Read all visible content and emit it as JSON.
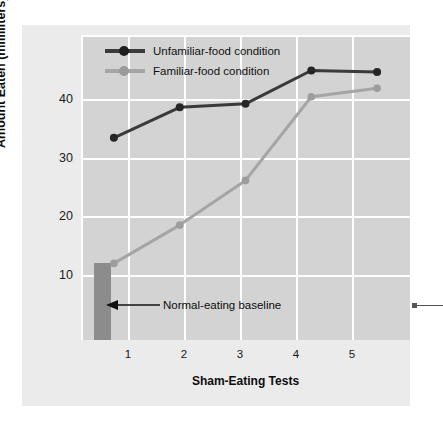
{
  "chart_data": {
    "type": "line",
    "title": "",
    "xlabel": "Sham-Eating Tests",
    "ylabel": "Amount Eaten (milliliters)",
    "categories": [
      "1",
      "2",
      "3",
      "4",
      "5"
    ],
    "x": [
      1,
      2,
      3,
      4,
      5
    ],
    "xlim": [
      0.5,
      5.5
    ],
    "ylim": [
      0,
      43
    ],
    "yticks": [
      10,
      20,
      30,
      40
    ],
    "ytick_labels": [
      "10",
      "20",
      "30",
      "40"
    ],
    "xtick_labels": [
      "1",
      "2",
      "3",
      "4",
      "5"
    ],
    "grid": "white gridlines, horizontal at y ticks and vertical at x ticks",
    "legend_position": "top-left inside plot",
    "series": [
      {
        "name": "Unfamiliar-food condition",
        "color": "#3a3a3a",
        "values": [
          28.5,
          32.8,
          33.3,
          38.0,
          37.8
        ]
      },
      {
        "name": "Familiar-food condition",
        "color": "#a5a5a5",
        "values": [
          10.8,
          16.2,
          22.5,
          34.3,
          35.5
        ]
      }
    ],
    "annotations": [
      {
        "label": "Normal-eating baseline",
        "type": "arrow-left",
        "target": "baseline-bar"
      }
    ],
    "baseline_bar": {
      "name": "Normal-eating baseline bar",
      "color": "#8c8c8c",
      "value": 10.8
    },
    "colors": {
      "figure_background": "#ebebeb",
      "plot_background": "#d3d3d3",
      "gridline": "#ffffff",
      "page_background": "#ffffff",
      "unfamiliar_series": "#3a3a3a",
      "familiar_series": "#a5a5a5",
      "baseline_bar": "#8c8c8c",
      "text": "#111111"
    }
  }
}
